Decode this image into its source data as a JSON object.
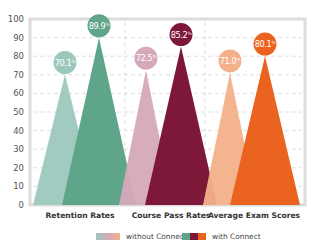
{
  "chart_data": {
    "type": "bar",
    "style": "triangle-peaks",
    "title": "",
    "xlabel": "",
    "ylabel": "",
    "ylim": [
      0,
      100
    ],
    "yticks": [
      0,
      10,
      20,
      30,
      40,
      50,
      60,
      70,
      80,
      90,
      100
    ],
    "grid": true,
    "legend_position": "bottom",
    "categories": [
      "Retention Rates",
      "Course Pass Rates",
      "Average Exam Scores"
    ],
    "series": [
      {
        "name": "without Connect",
        "values": [
          70.1,
          72.5,
          71.0
        ],
        "labels": [
          "70.1%",
          "72.5%",
          "71.0%"
        ],
        "colors": [
          "#9cc7bd",
          "#d5a9bb",
          "#f4b08a"
        ]
      },
      {
        "name": "with Connect",
        "values": [
          89.9,
          85.2,
          80.1
        ],
        "labels": [
          "89.9%",
          "85.2%",
          "80.1%"
        ],
        "colors": [
          "#5fa58a",
          "#7d1838",
          "#ea6420"
        ]
      }
    ]
  },
  "legend": {
    "without_label": "without Connect",
    "with_label": "with Connect",
    "without_gradient": [
      "#9cc7bd",
      "#d5a9bb",
      "#f4b08a"
    ],
    "with_gradient": [
      "#5fa58a",
      "#7d1838",
      "#ea6420"
    ]
  }
}
